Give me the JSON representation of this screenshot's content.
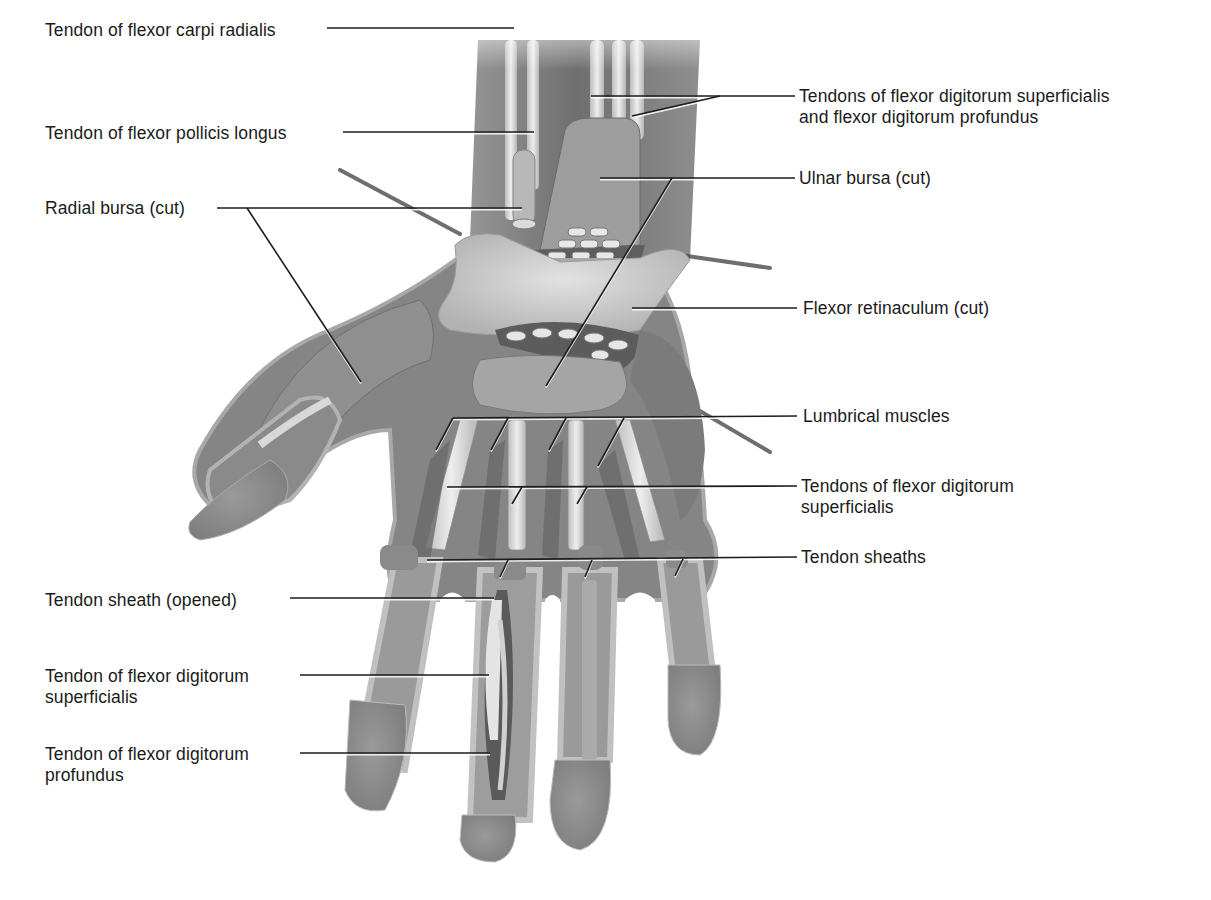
{
  "figure": {
    "colors": {
      "background": "#ffffff",
      "label_text": "#1a1a1a",
      "leader_line": "#1c1c1c",
      "muscle_dark": "#6e6e6e",
      "muscle_mid": "#8c8c8c",
      "tendon_light": "#d9d9d9",
      "retinaculum": "#c8c8c8",
      "skin_edge": "#bdbdbd",
      "fingertip": "#8a8a8a"
    }
  },
  "labels": [
    {
      "id": "fcr",
      "lines": [
        "Tendon of flexor carpi radialis"
      ],
      "x": 45,
      "y": 20,
      "align": "left"
    },
    {
      "id": "fpl",
      "lines": [
        "Tendon of flexor pollicis longus"
      ],
      "x": 45,
      "y": 123,
      "align": "left"
    },
    {
      "id": "radial_bursa",
      "lines": [
        "Radial bursa (cut)"
      ],
      "x": 45,
      "y": 198,
      "align": "left"
    },
    {
      "id": "fds_fdp",
      "lines": [
        "Tendons of flexor digitorum superficialis",
        "and flexor digitorum profundus"
      ],
      "x": 799,
      "y": 86,
      "align": "left"
    },
    {
      "id": "ulnar_bursa",
      "lines": [
        "Ulnar bursa (cut)"
      ],
      "x": 799,
      "y": 168,
      "align": "left"
    },
    {
      "id": "retinaculum",
      "lines": [
        "Flexor retinaculum (cut)"
      ],
      "x": 803,
      "y": 298,
      "align": "left"
    },
    {
      "id": "lumbricals",
      "lines": [
        "Lumbrical muscles"
      ],
      "x": 803,
      "y": 406,
      "align": "left"
    },
    {
      "id": "fds_tendons",
      "lines": [
        "Tendons of flexor digitorum",
        "superficialis"
      ],
      "x": 801,
      "y": 476,
      "align": "left"
    },
    {
      "id": "sheaths",
      "lines": [
        "Tendon sheaths"
      ],
      "x": 801,
      "y": 547,
      "align": "left"
    },
    {
      "id": "sheath_opened",
      "lines": [
        "Tendon sheath (opened)"
      ],
      "x": 45,
      "y": 590,
      "align": "left"
    },
    {
      "id": "fds_single",
      "lines": [
        "Tendon of flexor digitorum",
        "superficialis"
      ],
      "x": 45,
      "y": 666,
      "align": "left"
    },
    {
      "id": "fdp_single",
      "lines": [
        "Tendon of flexor digitorum",
        "profundus"
      ],
      "x": 45,
      "y": 744,
      "align": "left"
    }
  ],
  "leaders": [
    {
      "for": "fcr",
      "points": [
        [
          327,
          28
        ],
        [
          514,
          28
        ]
      ]
    },
    {
      "for": "fpl",
      "points": [
        [
          343,
          132
        ],
        [
          534,
          132
        ]
      ]
    },
    {
      "for": "radial_bursa",
      "points": [
        [
          217,
          208
        ],
        [
          522,
          208
        ]
      ]
    },
    {
      "for": "radial_bursa",
      "points": [
        [
          247,
          208
        ],
        [
          361,
          382
        ]
      ]
    },
    {
      "for": "fds_fdp",
      "points": [
        [
          795,
          96
        ],
        [
          591,
          96
        ]
      ]
    },
    {
      "for": "fds_fdp",
      "points": [
        [
          720,
          96
        ],
        [
          632,
          116
        ]
      ]
    },
    {
      "for": "ulnar_bursa",
      "points": [
        [
          795,
          178
        ],
        [
          600,
          178
        ]
      ]
    },
    {
      "for": "ulnar_bursa",
      "points": [
        [
          672,
          178
        ],
        [
          546,
          386
        ]
      ]
    },
    {
      "for": "retinaculum",
      "points": [
        [
          797,
          308
        ],
        [
          632,
          308
        ]
      ]
    },
    {
      "for": "lumbricals",
      "points": [
        [
          797,
          416
        ],
        [
          453,
          418
        ]
      ]
    },
    {
      "for": "lumbricals",
      "points": [
        [
          453,
          418
        ],
        [
          436,
          450
        ]
      ]
    },
    {
      "for": "lumbricals",
      "points": [
        [
          508,
          418
        ],
        [
          491,
          450
        ]
      ]
    },
    {
      "for": "lumbricals",
      "points": [
        [
          566,
          418
        ],
        [
          549,
          450
        ]
      ]
    },
    {
      "for": "lumbricals",
      "points": [
        [
          624,
          418
        ],
        [
          598,
          466
        ]
      ]
    },
    {
      "for": "fds_tendons",
      "points": [
        [
          797,
          486
        ],
        [
          447,
          487
        ]
      ]
    },
    {
      "for": "fds_tendons",
      "points": [
        [
          522,
          487
        ],
        [
          512,
          504
        ]
      ]
    },
    {
      "for": "fds_tendons",
      "points": [
        [
          587,
          487
        ],
        [
          577,
          504
        ]
      ]
    },
    {
      "for": "sheaths",
      "points": [
        [
          797,
          557
        ],
        [
          427,
          560
        ]
      ]
    },
    {
      "for": "sheaths",
      "points": [
        [
          508,
          560
        ],
        [
          500,
          577
        ]
      ]
    },
    {
      "for": "sheaths",
      "points": [
        [
          592,
          560
        ],
        [
          585,
          577
        ]
      ]
    },
    {
      "for": "sheaths",
      "points": [
        [
          683,
          559
        ],
        [
          675,
          576
        ]
      ]
    },
    {
      "for": "sheath_opened",
      "points": [
        [
          290,
          598
        ],
        [
          494,
          598
        ]
      ]
    },
    {
      "for": "fds_single",
      "points": [
        [
          300,
          675
        ],
        [
          489,
          675
        ]
      ]
    },
    {
      "for": "fdp_single",
      "points": [
        [
          300,
          753
        ],
        [
          490,
          753
        ]
      ]
    }
  ]
}
